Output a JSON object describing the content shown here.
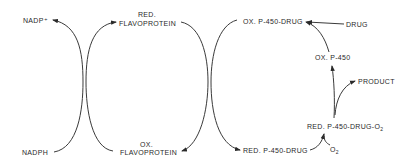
{
  "diagram": {
    "title": "",
    "nodes": {
      "nadp_plus": "NADP⁺",
      "nadph": "NADPH",
      "red_flavo_1": "RED.",
      "red_flavo_2": "FLAVOPROTEIN",
      "ox_flavo_1": "OX.",
      "ox_flavo_2": "FLAVOPROTEIN",
      "ox_p450_drug": "OX. P-450-DRUG",
      "drug": "DRUG",
      "ox_p450": "OX. P-450",
      "product": "PRODUCT",
      "red_p450_drug_o2_main": "RED. P-450-DRUG-O",
      "red_p450_drug_o2_sub": "2",
      "red_p450_drug": "RED. P-450-DRUG",
      "o2_main": "O",
      "o2_sub": "2"
    },
    "edges": [
      {
        "from": "NADPH",
        "to": "NADP⁺"
      },
      {
        "from": "OX. FLAVOPROTEIN",
        "to": "RED. FLAVOPROTEIN"
      },
      {
        "from": "RED. FLAVOPROTEIN",
        "to": "OX. FLAVOPROTEIN"
      },
      {
        "from": "OX. P-450-DRUG",
        "to": "RED. P-450-DRUG"
      },
      {
        "from": "RED. P-450-DRUG",
        "to": "RED. P-450-DRUG-O2"
      },
      {
        "from": "O2",
        "to": "RED. P-450-DRUG-O2"
      },
      {
        "from": "RED. P-450-DRUG-O2",
        "to": "OX. P-450"
      },
      {
        "from": "RED. P-450-DRUG-O2",
        "to": "PRODUCT"
      },
      {
        "from": "OX. P-450",
        "to": "OX. P-450-DRUG"
      },
      {
        "from": "DRUG",
        "to": "OX. P-450-DRUG"
      }
    ]
  }
}
